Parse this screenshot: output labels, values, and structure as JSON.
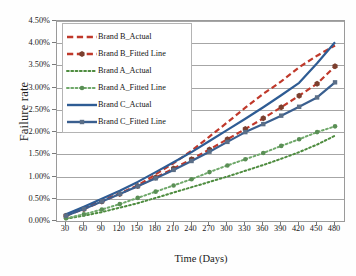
{
  "chart_data": {
    "type": "line",
    "title": "",
    "xlabel": "Time (Days)",
    "ylabel": "Failure rate",
    "x": [
      30,
      60,
      90,
      120,
      150,
      180,
      210,
      240,
      270,
      300,
      330,
      360,
      390,
      420,
      450,
      480
    ],
    "xtick_labels": [
      "30",
      "60",
      "90",
      "120",
      "150",
      "180",
      "210",
      "240",
      "270",
      "300",
      "330",
      "360",
      "390",
      "420",
      "450",
      "480"
    ],
    "ytick_labels": [
      "0.00%",
      "0.50%",
      "1.00%",
      "1.50%",
      "2.00%",
      "2.50%",
      "3.00%",
      "3.50%",
      "4.00%",
      "4.50%"
    ],
    "ytick_values": [
      0.0,
      0.5,
      1.0,
      1.5,
      2.0,
      2.5,
      3.0,
      3.5,
      4.0,
      4.5
    ],
    "ylim": [
      0.0,
      4.5
    ],
    "grid": true,
    "legend_position": "upper-left",
    "series": [
      {
        "name": "Brand B_Actual",
        "color": "#C0392B",
        "style": "dashed",
        "marker": "none",
        "values": [
          0.13,
          0.28,
          0.47,
          0.62,
          0.8,
          1.05,
          1.3,
          1.58,
          1.9,
          2.22,
          2.55,
          2.86,
          3.14,
          3.46,
          3.72,
          3.95
        ]
      },
      {
        "name": "Brand B_Fitted Line",
        "color": "#C0392B",
        "style": "dashed",
        "marker": "hexagon",
        "marker_color": "#7B3F2E",
        "values": [
          0.12,
          0.27,
          0.44,
          0.61,
          0.79,
          0.98,
          1.18,
          1.39,
          1.61,
          1.84,
          2.07,
          2.31,
          2.56,
          2.82,
          3.09,
          3.48
        ]
      },
      {
        "name": "Brand A_Actual",
        "color": "#4E8C3F",
        "style": "dotted",
        "marker": "none",
        "values": [
          0.05,
          0.12,
          0.2,
          0.3,
          0.4,
          0.52,
          0.64,
          0.76,
          0.88,
          1.0,
          1.13,
          1.26,
          1.4,
          1.55,
          1.72,
          1.92
        ]
      },
      {
        "name": "Brand A_Fitted Line",
        "color": "#6FA86A",
        "style": "dotted",
        "marker": "circle",
        "marker_color": "#5A8F55",
        "values": [
          0.06,
          0.15,
          0.26,
          0.38,
          0.52,
          0.66,
          0.8,
          0.94,
          1.1,
          1.25,
          1.39,
          1.53,
          1.69,
          1.84,
          2.0,
          2.13
        ]
      },
      {
        "name": "Brand C_Actual",
        "color": "#2E5C94",
        "style": "solid",
        "marker": "none",
        "values": [
          0.15,
          0.32,
          0.5,
          0.68,
          0.88,
          1.1,
          1.32,
          1.55,
          1.8,
          2.05,
          2.3,
          2.56,
          2.83,
          3.11,
          3.55,
          4.02
        ]
      },
      {
        "name": "Brand C_Fitted Line",
        "color": "#3A5F8F",
        "style": "solid",
        "marker": "square",
        "marker_color": "#5A6E87",
        "values": [
          0.12,
          0.27,
          0.44,
          0.61,
          0.78,
          0.96,
          1.15,
          1.35,
          1.56,
          1.78,
          2.0,
          2.18,
          2.37,
          2.57,
          2.78,
          3.12
        ]
      }
    ]
  }
}
